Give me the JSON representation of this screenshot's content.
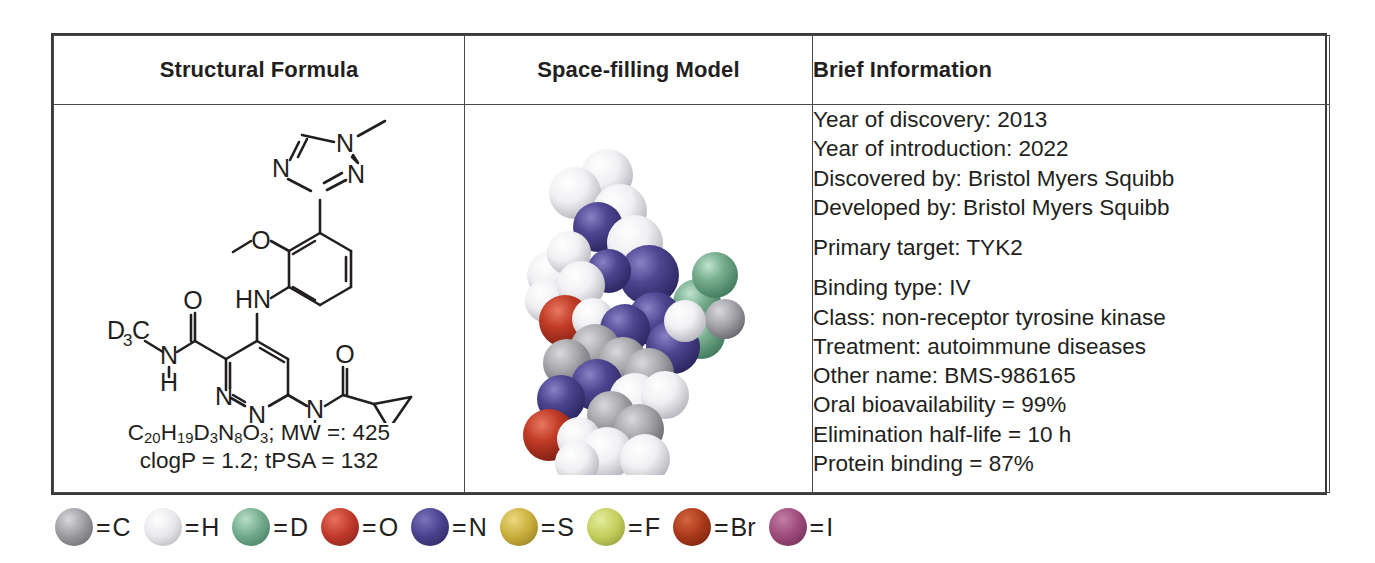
{
  "table": {
    "headers": [
      {
        "label": "Structural Formula"
      },
      {
        "label": "Space-filling Model"
      },
      {
        "label": "Brief Information"
      }
    ],
    "structure": {
      "molecule_labels": {
        "n_methyl_triazole_n1": "N",
        "triazole_n2": "N",
        "triazole_n4": "N",
        "methoxy_o": "O",
        "aniline_nh": "HN",
        "amide_o_left": "O",
        "amide_n_left": "N",
        "amide_h_left": "H",
        "d3c": "D",
        "d3c_sub": "3",
        "d3c_c": "C",
        "pyridazine_n1": "N",
        "pyridazine_n2": "N",
        "amide_n_right": "N",
        "amide_h_right": "H",
        "amide_o_right": "O"
      },
      "formula_line1_parts": {
        "c": "C",
        "c_n": "20",
        "h": "H",
        "h_n": "19",
        "d": "D",
        "d_n": "3",
        "nn": "N",
        "n_n": "8",
        "o": "O",
        "o_n": "3",
        "tail": "; MW =: 425"
      },
      "formula_line2": "clogP = 1.2; tPSA = 132"
    },
    "model": {
      "alt": "space-filling-model-of-deucravacitinib"
    },
    "info": {
      "groups": [
        {
          "lines": [
            "Year of discovery: 2013",
            "Year of introduction: 2022",
            "Discovered by: Bristol Myers Squibb",
            "Developed by: Bristol Myers Squibb"
          ]
        },
        {
          "lines": [
            "Primary target: TYK2"
          ]
        },
        {
          "lines": [
            "Binding type: IV",
            "Class: non-receptor tyrosine kinase",
            "Treatment: autoimmune diseases",
            "Other name: BMS-986165",
            "Oral bioavailability = 99%",
            "Elimination half-life = 10 h",
            "Protein binding = 87%"
          ]
        }
      ]
    }
  },
  "legend": {
    "equals": "=",
    "items": [
      {
        "symbol": "C",
        "color": "#9a9a9e",
        "highlight": "#d8d8dc",
        "shadow": "#5e5e62"
      },
      {
        "symbol": "H",
        "color": "#e8e8ec",
        "highlight": "#ffffff",
        "shadow": "#a9a9b0"
      },
      {
        "symbol": "D",
        "color": "#6fa98a",
        "highlight": "#b6ddc6",
        "shadow": "#3e7359"
      },
      {
        "symbol": "O",
        "color": "#c0392b",
        "highlight": "#e8705f",
        "shadow": "#7d2119"
      },
      {
        "symbol": "N",
        "color": "#49418c",
        "highlight": "#7b73bb",
        "shadow": "#2a2459"
      },
      {
        "symbol": "S",
        "color": "#c9ae3c",
        "highlight": "#ecd97f",
        "shadow": "#8a7520"
      },
      {
        "symbol": "F",
        "color": "#c2cf5c",
        "highlight": "#e3eb9c",
        "shadow": "#879133"
      },
      {
        "symbol": "Br",
        "color": "#a8381a",
        "highlight": "#d4653f",
        "shadow": "#6b2008"
      },
      {
        "symbol": "I",
        "color": "#9c4a7a",
        "highlight": "#c37ea4",
        "shadow": "#642c4e"
      }
    ]
  },
  "colors": {
    "border": "#3a3a3c",
    "text": "#231f20",
    "background": "#ffffff"
  }
}
